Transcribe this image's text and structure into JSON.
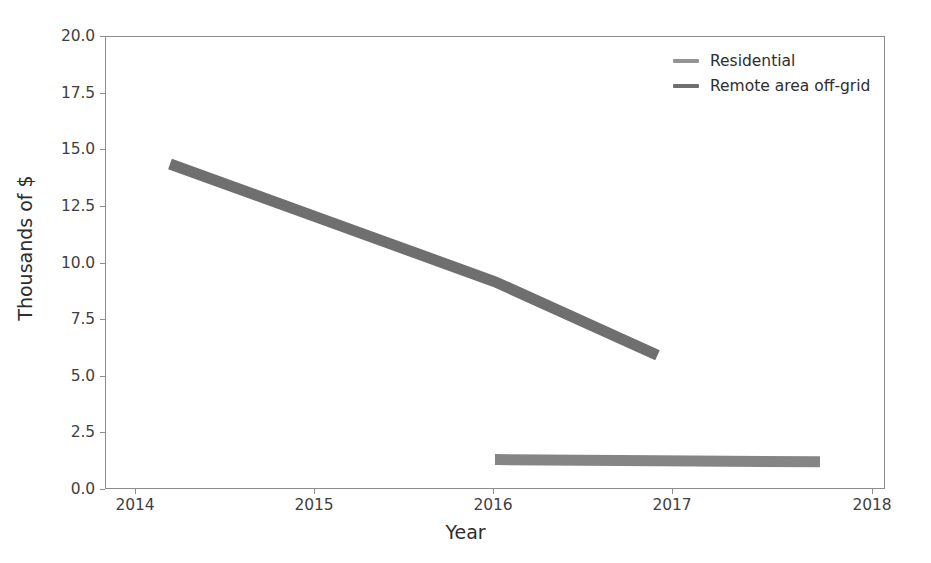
{
  "chart_data": {
    "type": "line",
    "title": "",
    "xlabel": "Year",
    "ylabel": "Thousands of $",
    "xlim": [
      2013.6,
      2018.4
    ],
    "ylim": [
      0.0,
      20.0
    ],
    "grid": false,
    "legend_position": "upper right",
    "xticks": [
      2014,
      2015,
      2016,
      2017,
      2018
    ],
    "xticklabels": [
      "2014",
      "2015",
      "2016",
      "2017",
      "2018"
    ],
    "yticks": [
      0.0,
      2.5,
      5.0,
      7.5,
      10.0,
      12.5,
      15.0,
      17.5,
      20.0
    ],
    "yticklabels": [
      "0.0",
      "2.5",
      "5.0",
      "7.5",
      "10.0",
      "12.5",
      "15.0",
      "17.5",
      "20.0"
    ],
    "series": [
      {
        "name": "Residential",
        "color": "#6f6f6f",
        "linewidth": 11,
        "x": [
          2014,
          2015,
          2016,
          2017
        ],
        "values": [
          14.35,
          11.75,
          9.15,
          5.9
        ]
      },
      {
        "name": "Remote area off-grid",
        "color": "#858585",
        "linewidth": 11,
        "x": [
          2016,
          2017,
          2018
        ],
        "values": [
          1.3,
          1.25,
          1.2
        ]
      }
    ]
  },
  "legend": {
    "entries": [
      {
        "label": "Residential",
        "color": "#949494"
      },
      {
        "label": "Remote area off-grid",
        "color": "#6f6f6f"
      }
    ]
  },
  "axis": {
    "x_title": "Year",
    "y_title": "Thousands of $"
  }
}
